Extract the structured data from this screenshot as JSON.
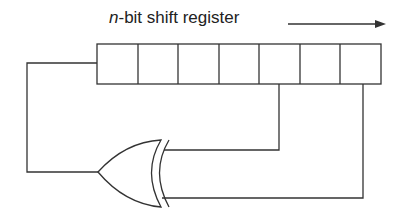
{
  "diagram": {
    "title_var": "n",
    "title_rest": "-bit shift register",
    "direction": "right",
    "register": {
      "cells": 7
    },
    "gate": {
      "type": "XOR",
      "inputs": [
        "cell-5 tap",
        "cell-7 tap"
      ],
      "output": "feedback to cell-1"
    },
    "colors": {
      "stroke": "#333333",
      "background": "#ffffff"
    }
  }
}
